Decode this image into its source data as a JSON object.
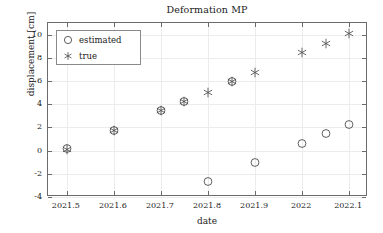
{
  "chart_data": {
    "type": "scatter",
    "title": "Deformation MP",
    "xlabel": "date",
    "ylabel": "displacement [cm]",
    "xlim": [
      2021.46,
      2022.14
    ],
    "ylim": [
      -4,
      11
    ],
    "xticks": [
      2021.5,
      2021.6,
      2021.7,
      2021.8,
      2021.9,
      2022,
      2022.1
    ],
    "xticklabels": [
      "2021.5",
      "2021.6",
      "2021.7",
      "2021.8",
      "2021.9",
      "2022",
      "2022.1"
    ],
    "yticks": [
      -4,
      -2,
      0,
      2,
      4,
      6,
      8,
      10
    ],
    "yticklabels": [
      "-4",
      "-2",
      "0",
      "2",
      "4",
      "6",
      "8",
      "10"
    ],
    "grid": true,
    "legend_position": "top-left",
    "series": [
      {
        "name": "estimated",
        "marker": "circle",
        "color": "#4d4d4d",
        "x": [
          2021.5,
          2021.6,
          2021.7,
          2021.75,
          2021.8,
          2021.85,
          2021.9,
          2022.0,
          2022.05,
          2022.1
        ],
        "y": [
          0.1,
          1.7,
          3.4,
          4.2,
          -2.7,
          5.9,
          -1.1,
          0.55,
          1.4,
          2.25
        ]
      },
      {
        "name": "true",
        "marker": "asterisk",
        "color": "#4d4d4d",
        "x": [
          2021.5,
          2021.6,
          2021.7,
          2021.75,
          2021.8,
          2021.85,
          2021.9,
          2022.0,
          2022.05,
          2022.1
        ],
        "y": [
          0.05,
          1.7,
          3.4,
          4.2,
          5.0,
          5.9,
          6.7,
          8.4,
          9.2,
          10.05
        ]
      }
    ]
  },
  "legend": {
    "entries": [
      {
        "label": "estimated",
        "marker": "circle"
      },
      {
        "label": "true",
        "marker": "asterisk"
      }
    ]
  },
  "colors": {
    "axis": "#6b6b6b",
    "grid": "#ececec",
    "marker": "#4d4d4d",
    "text": "#1a1a1a",
    "background": "#ffffff"
  }
}
